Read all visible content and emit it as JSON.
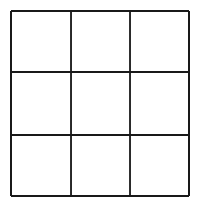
{
  "figure": {
    "name": "three-by-three-grid",
    "caption": "",
    "title": "",
    "style": "vintage engraving / hand-inked line art",
    "background_color": "#ffffff",
    "line_color": "#1a1a1a",
    "line_width_px": 2,
    "canvas": {
      "width_px": 201,
      "height_px": 206
    }
  },
  "grid": {
    "rows": 3,
    "columns": 3,
    "cell_count": 9,
    "vertical_line_x": [
      11,
      71,
      130,
      189
    ],
    "horizontal_line_y": [
      11,
      72,
      135,
      196
    ],
    "bounds": {
      "left_px": 11,
      "top_px": 11,
      "right_px": 189,
      "bottom_px": 196,
      "width_px": 178,
      "height_px": 185
    },
    "cells": [
      {
        "id": "cell-r1c1",
        "row": 1,
        "column": 1,
        "label": ""
      },
      {
        "id": "cell-r1c2",
        "row": 1,
        "column": 2,
        "label": ""
      },
      {
        "id": "cell-r1c3",
        "row": 1,
        "column": 3,
        "label": ""
      },
      {
        "id": "cell-r2c1",
        "row": 2,
        "column": 1,
        "label": ""
      },
      {
        "id": "cell-r2c2",
        "row": 2,
        "column": 2,
        "label": ""
      },
      {
        "id": "cell-r2c3",
        "row": 2,
        "column": 3,
        "label": ""
      },
      {
        "id": "cell-r3c1",
        "row": 3,
        "column": 1,
        "label": ""
      },
      {
        "id": "cell-r3c2",
        "row": 3,
        "column": 2,
        "label": ""
      },
      {
        "id": "cell-r3c3",
        "row": 3,
        "column": 3,
        "label": ""
      }
    ],
    "lines": [
      {
        "id": "border-top",
        "orientation": "horizontal",
        "x1": 11,
        "y1": 11,
        "x2": 189,
        "y2": 11,
        "role": "outer-border"
      },
      {
        "id": "border-bottom",
        "orientation": "horizontal",
        "x1": 11,
        "y1": 196,
        "x2": 189,
        "y2": 196,
        "role": "outer-border"
      },
      {
        "id": "border-left",
        "orientation": "vertical",
        "x1": 11,
        "y1": 11,
        "x2": 11,
        "y2": 196,
        "role": "outer-border"
      },
      {
        "id": "border-right",
        "orientation": "vertical",
        "x1": 189,
        "y1": 11,
        "x2": 189,
        "y2": 196,
        "role": "outer-border"
      },
      {
        "id": "inner-horizontal-1",
        "orientation": "horizontal",
        "x1": 11,
        "y1": 72,
        "x2": 189,
        "y2": 72,
        "role": "inner-divider"
      },
      {
        "id": "inner-horizontal-2",
        "orientation": "horizontal",
        "x1": 11,
        "y1": 135,
        "x2": 189,
        "y2": 135,
        "role": "inner-divider"
      },
      {
        "id": "inner-vertical-1",
        "orientation": "vertical",
        "x1": 71,
        "y1": 11,
        "x2": 71,
        "y2": 196,
        "role": "inner-divider"
      },
      {
        "id": "inner-vertical-2",
        "orientation": "vertical",
        "x1": 130,
        "y1": 11,
        "x2": 130,
        "y2": 196,
        "role": "inner-divider"
      }
    ]
  }
}
